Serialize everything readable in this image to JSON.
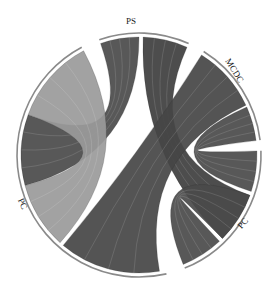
{
  "chart_data": {
    "type": "chord",
    "title": "",
    "center": [
      139,
      155
    ],
    "radius": 118,
    "groups": [
      {
        "id": "PS",
        "label": "PS",
        "start_deg": -109,
        "end_deg": -66,
        "color": "#4a4a4a"
      },
      {
        "id": "MCDC",
        "label": "MCDC",
        "start_deg": -58,
        "end_deg": -7,
        "color": "#4a4a4a"
      },
      {
        "id": "PC_right",
        "label": "PC",
        "start_deg": -2,
        "end_deg": 68,
        "color": "#4a4a4a"
      },
      {
        "id": "PC_left",
        "label": "PC",
        "start_deg": 77,
        "end_deg": 242,
        "color": "#9a9a9a"
      }
    ],
    "chords": [
      {
        "from": "PS",
        "to": "PC_left",
        "from_range": [
          -109,
          -90
        ],
        "to_range": [
          165,
          200
        ],
        "color": "#4a4a4a"
      },
      {
        "from": "PS",
        "to": "PC_right",
        "from_range": [
          -88,
          -66
        ],
        "to_range": [
          20,
          45
        ],
        "color": "#3e3e3e"
      },
      {
        "from": "MCDC",
        "to": "PC_left",
        "from_range": [
          -58,
          -25
        ],
        "to_range": [
          80,
          130
        ],
        "color": "#454545"
      },
      {
        "from": "MCDC",
        "to": "PC_right",
        "from_range": [
          -24,
          -7
        ],
        "to_range": [
          -2,
          18
        ],
        "color": "#4a4a4a"
      },
      {
        "from": "PC_right",
        "to": "PC_right",
        "from_range": [
          47,
          68
        ],
        "to_range": [
          20,
          45
        ],
        "color": "#4a4a4a"
      },
      {
        "from": "PC_left",
        "to": "PC_left",
        "from_range": [
          200,
          242
        ],
        "to_range": [
          132,
          165
        ],
        "color": "#9a9a9a"
      }
    ],
    "labels": [
      "PS",
      "MCDC",
      "PC",
      "PC"
    ],
    "legend": null
  },
  "labels": {
    "ps": "PS",
    "mcdc": "MCDC",
    "pc_right": "PC",
    "pc_left": "PC"
  }
}
